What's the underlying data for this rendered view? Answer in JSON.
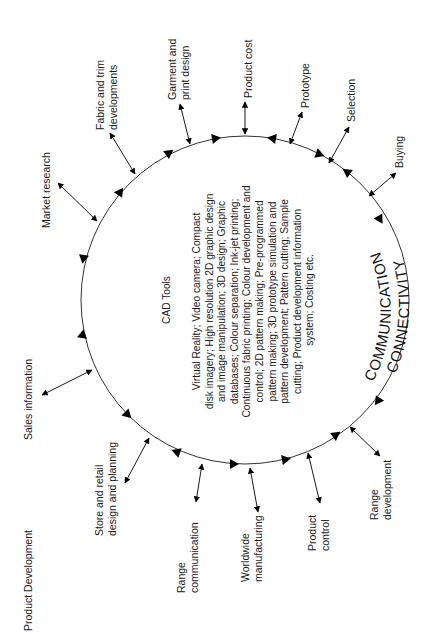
{
  "figure": {
    "title": "Product Development",
    "core_title": "CAD Tools",
    "core_lines": [
      "Virtual Reality; Video camera; Compact",
      "disk imagery; High resolution 2D graphic design",
      "and image manipulation; 3D design; Graphic",
      "databases; Colour separation; Ink-jet printing;",
      "Continuous fabric printing; Colour development and",
      "control; 2D pattern making; Pre-programmed",
      "pattern making; 3D prototype simulation and",
      "pattern development; Pattern cutting; Sample",
      "cutting; Product development information",
      "system; Costing etc."
    ],
    "ring_label_line1": "COMMUNICATION",
    "ring_label_line2": "CONNECTIVITY",
    "orientation": "rotated 90 degrees counter-clockwise"
  },
  "nodes": [
    {
      "id": "market-research",
      "lines": [
        "Market research"
      ]
    },
    {
      "id": "fabric-trim",
      "lines": [
        "Fabric and trim",
        "developments"
      ]
    },
    {
      "id": "garment-print",
      "lines": [
        "Garment and",
        "print design"
      ]
    },
    {
      "id": "product-cost",
      "lines": [
        "Product cost"
      ]
    },
    {
      "id": "prototype",
      "lines": [
        "Prototype"
      ]
    },
    {
      "id": "selection",
      "lines": [
        "Selection"
      ]
    },
    {
      "id": "buying",
      "lines": [
        "Buying"
      ]
    },
    {
      "id": "range-development",
      "lines": [
        "Range",
        "development"
      ]
    },
    {
      "id": "product-control",
      "lines": [
        "Product",
        "control"
      ]
    },
    {
      "id": "worldwide-manufacturing",
      "lines": [
        "Worldwide",
        "manufacturing"
      ]
    },
    {
      "id": "range-communication",
      "lines": [
        "Range",
        "communication"
      ]
    },
    {
      "id": "store-retail",
      "lines": [
        "Store and retail",
        "design and planning"
      ]
    },
    {
      "id": "sales-information",
      "lines": [
        "Sales information"
      ]
    }
  ],
  "colors": {
    "line": "#333333",
    "arrow": "#000000",
    "text": "#1a1a1a",
    "background": "#ffffff"
  }
}
